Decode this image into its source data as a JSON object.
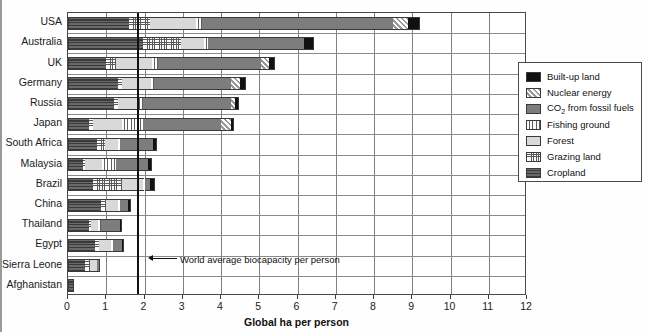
{
  "chart_data": {
    "type": "bar",
    "orientation": "horizontal",
    "stacked": true,
    "title": "",
    "xlabel": "Global ha per person",
    "ylabel": "",
    "xlim": [
      0,
      12
    ],
    "xticks": [
      0,
      1,
      2,
      3,
      4,
      5,
      6,
      7,
      8,
      9,
      10,
      11,
      12
    ],
    "grid": "vertical",
    "legend_position": "right",
    "categories": [
      "USA",
      "Australia",
      "UK",
      "Germany",
      "Russia",
      "Japan",
      "South Africa",
      "Malaysia",
      "Brazil",
      "China",
      "Thailand",
      "Egypt",
      "Sierra Leone",
      "Afghanistan"
    ],
    "series": [
      {
        "name": "Cropland",
        "key": "cropland",
        "values": [
          1.6,
          1.95,
          1.0,
          1.3,
          1.2,
          0.55,
          0.75,
          0.4,
          0.65,
          0.85,
          0.55,
          0.7,
          0.45,
          0.12
        ]
      },
      {
        "name": "Grazing land",
        "key": "grazing",
        "values": [
          0.55,
          1.0,
          0.25,
          0.12,
          0.1,
          0.1,
          0.22,
          0.05,
          0.75,
          0.15,
          0.05,
          0.12,
          0.12,
          0.03
        ]
      },
      {
        "name": "Forest",
        "key": "forest",
        "values": [
          1.2,
          0.6,
          0.95,
          0.75,
          0.5,
          0.75,
          0.35,
          0.45,
          0.55,
          0.3,
          0.18,
          0.3,
          0.18,
          0.0
        ]
      },
      {
        "name": "Fishing ground",
        "key": "fishing",
        "values": [
          0.15,
          0.12,
          0.15,
          0.08,
          0.15,
          0.55,
          0.05,
          0.35,
          0.05,
          0.05,
          0.07,
          0.05,
          0.02,
          0.0
        ]
      },
      {
        "name": "CO2 from fossil fuels",
        "key": "co2",
        "values": [
          5.0,
          2.5,
          2.7,
          2.0,
          2.3,
          2.05,
          0.85,
          0.85,
          0.15,
          0.22,
          0.52,
          0.25,
          0.03,
          0.0
        ]
      },
      {
        "name": "Nuclear energy",
        "key": "nuclear",
        "values": [
          0.4,
          0.0,
          0.2,
          0.25,
          0.12,
          0.25,
          0.0,
          0.0,
          0.0,
          0.0,
          0.0,
          0.0,
          0.0,
          0.0
        ]
      },
      {
        "name": "Built-up land",
        "key": "builtup",
        "values": [
          0.3,
          0.25,
          0.15,
          0.15,
          0.1,
          0.1,
          0.12,
          0.1,
          0.12,
          0.08,
          0.05,
          0.05,
          0.02,
          0.0
        ]
      }
    ],
    "totals": [
      9.2,
      6.42,
      5.4,
      4.65,
      4.47,
      4.35,
      2.34,
      2.2,
      2.27,
      1.65,
      1.42,
      1.47,
      0.82,
      0.15
    ],
    "annotations": [
      {
        "label": "World average biocapacity per person",
        "value": 1.8,
        "type": "vline-with-arrow"
      }
    ]
  },
  "legend": {
    "items": [
      {
        "label": "Built-up land",
        "key": "builtup",
        "swatch": "solid-black"
      },
      {
        "label": "Nuclear energy",
        "key": "nuclear",
        "swatch": "diagonal-hatch"
      },
      {
        "label": "CO2 from fossil fuels",
        "label_pre": "CO",
        "label_sub": "2",
        "label_post": " from fossil fuels",
        "key": "co2",
        "swatch": "solid-gray"
      },
      {
        "label": "Fishing ground",
        "key": "fishing",
        "swatch": "vertical-lines"
      },
      {
        "label": "Forest",
        "key": "forest",
        "swatch": "light-gray"
      },
      {
        "label": "Grazing land",
        "key": "grazing",
        "swatch": "dotted-grid"
      },
      {
        "label": "Cropland",
        "key": "cropland",
        "swatch": "horizontal-lines"
      }
    ]
  },
  "colors": {
    "builtup": "#111111",
    "co2": "#7d7d7d",
    "forest": "#d9d9d9",
    "cropland": "#4d4d4d",
    "axis": "#3a3a3a",
    "grid": "#808080",
    "background": "#ffffff"
  }
}
